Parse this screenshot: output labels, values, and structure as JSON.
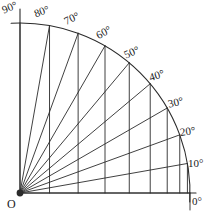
{
  "figure": {
    "kind": "quarter-circle-protractor",
    "origin_label": "O",
    "width": 211,
    "height": 217,
    "background_color": "#ffffff",
    "line_color": "#2b2b2b"
  },
  "chart_data": {
    "type": "line",
    "title": "",
    "xlabel": "",
    "ylabel": "",
    "grid": true,
    "legend_position": "none",
    "center": {
      "x": 20,
      "y": 193
    },
    "radius": 170,
    "angle_step": 10,
    "angle_min": 0,
    "angle_max": 90,
    "categories": [
      "0°",
      "10°",
      "20°",
      "30°",
      "40°",
      "50°",
      "60°",
      "70°",
      "80°",
      "90°"
    ],
    "values": [
      0,
      10,
      20,
      30,
      40,
      50,
      60,
      70,
      80,
      90
    ],
    "series": [
      {
        "name": "arc-points",
        "x": [
          170.0,
          167.4,
          159.7,
          147.2,
          130.2,
          109.3,
          85.0,
          58.1,
          29.5,
          0.0
        ],
        "y": [
          0.0,
          29.5,
          58.1,
          85.0,
          109.3,
          130.2,
          147.2,
          159.7,
          167.4,
          170.0
        ]
      },
      {
        "name": "chord-baseline-x",
        "values": [
          170.0,
          167.4,
          159.7,
          147.2,
          130.2,
          109.3,
          85.0,
          58.1,
          29.5,
          0.0
        ]
      }
    ],
    "ticks": [
      {
        "angle": 0,
        "label": "0°",
        "label_x": 192,
        "label_y": 196,
        "rot": 0
      },
      {
        "angle": 10,
        "label": "10°",
        "label_x": 188,
        "label_y": 158,
        "rot": 0
      },
      {
        "angle": 20,
        "label": "20°",
        "label_x": 180,
        "label_y": 126,
        "rot": -8
      },
      {
        "angle": 30,
        "label": "30°",
        "label_x": 168,
        "label_y": 97,
        "rot": -14
      },
      {
        "angle": 40,
        "label": "40°",
        "label_x": 149,
        "label_y": 70,
        "rot": -18
      },
      {
        "angle": 50,
        "label": "50°",
        "label_x": 124,
        "label_y": 47,
        "rot": -24
      },
      {
        "angle": 60,
        "label": "60°",
        "label_x": 96,
        "label_y": 27,
        "rot": -28
      },
      {
        "angle": 70,
        "label": "70°",
        "label_x": 64,
        "label_y": 13,
        "rot": -26
      },
      {
        "angle": 80,
        "label": "80°",
        "label_x": 34,
        "label_y": 6,
        "rot": -20
      },
      {
        "angle": 90,
        "label": "90°",
        "label_x": 2,
        "label_y": 2,
        "rot": -22
      }
    ]
  }
}
